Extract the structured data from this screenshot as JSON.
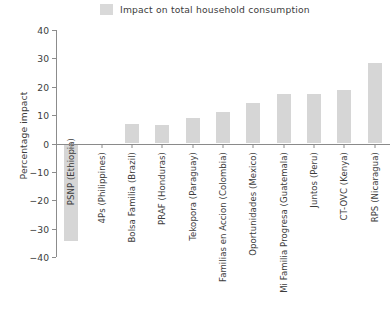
{
  "legend": {
    "label": "Impact on total household consumption",
    "swatch_color": "#d9d9d9"
  },
  "axes": {
    "y_title": "Percentage impact",
    "y_ticks": [
      "40",
      "30",
      "20",
      "10",
      "0",
      "-10",
      "-20",
      "-30",
      "-40"
    ],
    "x_title": ""
  },
  "chart_data": {
    "type": "bar",
    "title": "",
    "xlabel": "",
    "ylabel": "Percentage impact",
    "ylim": [
      -40,
      40
    ],
    "ytick_step": 10,
    "grid": false,
    "legend_position": "top-center",
    "series_name": "Impact on total household consumption",
    "bar_color": "#d6d6d6",
    "categories": [
      "PSNP (Ethiopia)",
      "4Ps (Philippines)",
      "Bolsa Familia (Brazil)",
      "PRAF (Honduras)",
      "Tekopora (Paraguay)",
      "Familias en Accion (Colombia)",
      "Oportunidades (Mexico)",
      "Mi Familia Progresa (Guatemala)",
      "Juntos (Peru)",
      "CT-OVC (Kenya)",
      "RPS (Nicaragua)"
    ],
    "values": [
      -34.5,
      0.0,
      6.8,
      6.6,
      9.0,
      11.0,
      14.3,
      17.6,
      17.6,
      19.0,
      28.5
    ]
  }
}
